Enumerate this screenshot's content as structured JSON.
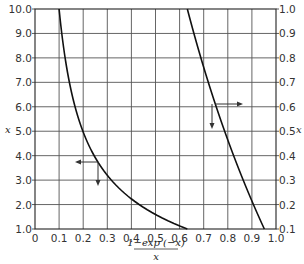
{
  "chart_data": {
    "type": "line",
    "title": "",
    "xlabel": "(1-exp(-x))/x",
    "xlabel_numerator": "1−exp (−x)",
    "xlabel_denominator": "x",
    "ylabel_left": "x",
    "ylabel_right": "x",
    "xlim": [
      0,
      1.0
    ],
    "ylim_left": [
      1.0,
      10.0
    ],
    "ylim_right": [
      0.1,
      1.0
    ],
    "grid": true,
    "x_ticks": [
      "0",
      "0.1",
      "0.2",
      "0.3",
      "0.4",
      "0.5",
      "0.6",
      "0.7",
      "0.8",
      "0.9",
      "1.0"
    ],
    "y_ticks_left": [
      "1.0",
      "2.0",
      "3.0",
      "4.0",
      "5.0",
      "6.0",
      "7.0",
      "8.0",
      "9.0",
      "10.0"
    ],
    "y_ticks_right": [
      "0.1",
      "0.2",
      "0.3",
      "0.4",
      "0.5",
      "0.6",
      "0.7",
      "0.8",
      "0.9",
      "1.0"
    ],
    "series": [
      {
        "name": "left axis curve (x from 1 to 10)",
        "axis": "left",
        "x": [
          0.1,
          0.111,
          0.125,
          0.143,
          0.166,
          0.199,
          0.245,
          0.317,
          0.432,
          0.632
        ],
        "y": [
          10.0,
          9.0,
          8.0,
          7.0,
          6.0,
          5.0,
          4.0,
          3.0,
          2.0,
          1.0
        ]
      },
      {
        "name": "right axis curve (x from 0.1 to 1.0)",
        "axis": "right",
        "x": [
          0.632,
          0.659,
          0.688,
          0.719,
          0.752,
          0.787,
          0.824,
          0.864,
          0.906,
          0.952
        ],
        "y": [
          1.0,
          0.9,
          0.8,
          0.7,
          0.6,
          0.5,
          0.4,
          0.3,
          0.2,
          0.1
        ]
      }
    ],
    "annotations": [
      {
        "type": "arrow-pair",
        "description": "left-pointing arrow and down arrow indicating left curve reads against left axis",
        "near": [
          0.26,
          4.2
        ]
      },
      {
        "type": "arrow-pair",
        "description": "right-pointing arrow and down arrow indicating right curve reads against right axis",
        "near": [
          0.74,
          0.6
        ]
      }
    ]
  }
}
